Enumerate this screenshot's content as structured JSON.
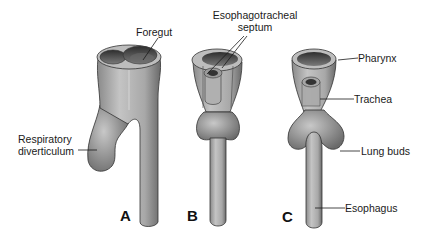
{
  "figure": {
    "panels": [
      {
        "id": "A",
        "label": "A"
      },
      {
        "id": "B",
        "label": "B"
      },
      {
        "id": "C",
        "label": "C"
      }
    ],
    "labels": {
      "foregut": "Foregut",
      "septum_line1": "Esophagotracheal",
      "septum_line2": "septum",
      "respiratory_line1": "Respiratory",
      "respiratory_line2": "diverticulum",
      "pharynx": "Pharynx",
      "trachea": "Trachea",
      "lung_buds": "Lung buds",
      "esophagus": "Esophagus"
    },
    "colors": {
      "tissue_fill": "#b9b9b9",
      "tissue_dark": "#6e6e6e",
      "lumen": "#4a4a4a",
      "outline": "#2a2a2a",
      "text": "#1a1a1a"
    }
  }
}
